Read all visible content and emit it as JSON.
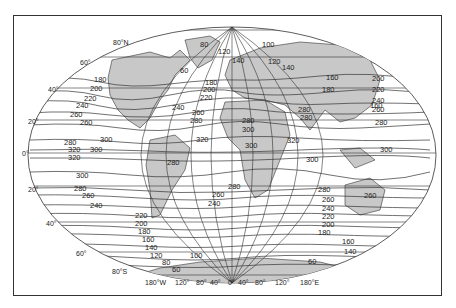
{
  "figure": {
    "type": "world-map-isolines",
    "projection": "oval (Robinson-like)",
    "land_fill": "#c8c8c8",
    "ocean_fill": "#ffffff",
    "line_color": "#333333"
  },
  "axes": {
    "latitude_labels": [
      "80°N",
      "60°",
      "40°",
      "20°",
      "0°",
      "20°",
      "40°",
      "60°",
      "80°S"
    ],
    "longitude_labels": [
      "180°W",
      "120°",
      "80°",
      "40°",
      "0°",
      "40°",
      "80°",
      "120°",
      "180°E"
    ]
  },
  "isoline_labels": {
    "north_atlantic": [
      "180",
      "200",
      "220",
      "240",
      "260",
      "280",
      "300"
    ],
    "north_pacific": [
      "180",
      "200",
      "220",
      "240",
      "260",
      "280"
    ],
    "arctic": [
      "80",
      "100",
      "120",
      "140",
      "60",
      "160"
    ],
    "europe_asia": [
      "180",
      "200",
      "220",
      "240",
      "260",
      "280",
      "300",
      "320"
    ],
    "tropics": [
      "280",
      "300",
      "320",
      "300",
      "320",
      "300"
    ],
    "south_pacific": [
      "300",
      "280",
      "260",
      "240",
      "220",
      "200",
      "180",
      "160",
      "140",
      "120",
      "100",
      "80",
      "60"
    ],
    "south_indian": [
      "280",
      "260",
      "240",
      "220",
      "200",
      "180",
      "160",
      "140",
      "60"
    ],
    "australia": [
      "260"
    ],
    "south_america": [
      "280"
    ]
  },
  "labels": {
    "lat_80N": "80°N",
    "lat_60N": "60°",
    "lat_40N": "40°",
    "lat_20N": "20°",
    "lat_0": "0°",
    "lat_20S": "20°",
    "lat_40S": "40°",
    "lat_60S": "60°",
    "lat_80S": "80°S",
    "lon_180W": "180°W",
    "lon_120W": "120°",
    "lon_80W": "80°",
    "lon_40W": "40°",
    "lon_0": "0°",
    "lon_40E": "40°",
    "lon_80E": "80°",
    "lon_120E": "120°",
    "lon_180E": "180°E",
    "c1": "180",
    "c2": "200",
    "c3": "220",
    "c4": "240",
    "c5": "260",
    "c6": "280",
    "c7": "300",
    "c8": "320",
    "c9": "320",
    "c10": "300",
    "c11": "300",
    "c12": "280",
    "c13": "260",
    "c14": "240",
    "c15": "220",
    "c16": "200",
    "c17": "180",
    "c18": "160",
    "c19": "140",
    "c20": "120",
    "c21": "80",
    "c22": "60",
    "c23": "100",
    "c24": "80",
    "c25": "120",
    "c26": "140",
    "c27": "100",
    "c28": "120",
    "c29": "140",
    "c30": "160",
    "c31": "180",
    "c32": "200",
    "c33": "220",
    "c34": "240",
    "c35": "260",
    "c36": "280",
    "c37": "300",
    "c38": "280",
    "c39": "300",
    "c40": "320",
    "c41": "300",
    "c42": "280",
    "c43": "260",
    "c44": "240",
    "c45": "220",
    "c46": "200",
    "c47": "180",
    "c48": "160",
    "c49": "140",
    "c50": "60",
    "c51": "260",
    "c52": "280",
    "c53": "180",
    "c54": "200",
    "c55": "220",
    "c56": "240",
    "c57": "260",
    "c58": "60",
    "c59": "200",
    "c60": "220",
    "c61": "240",
    "c62": "260",
    "c63": "280",
    "c64": "300"
  }
}
